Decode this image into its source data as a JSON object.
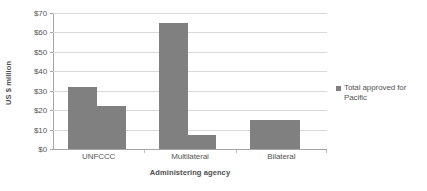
{
  "chart_data": {
    "type": "bar",
    "title": "",
    "categories": [
      "UNFCCC",
      "Multilateral",
      "Bilateral"
    ],
    "series": [
      {
        "name": "Total approved for Pacific",
        "color": "#808080",
        "bars": [
          {
            "category": "UNFCCC",
            "value": 32,
            "x_px": 68,
            "width_px": 29
          },
          {
            "category": "UNFCCC",
            "value": 22,
            "x_px": 97,
            "width_px": 29
          },
          {
            "category": "Multilateral",
            "value": 65,
            "x_px": 159,
            "width_px": 29
          },
          {
            "category": "Multilateral",
            "value": 7,
            "x_px": 188,
            "width_px": 28
          },
          {
            "category": "Bilateral",
            "value": 15,
            "x_px": 250,
            "width_px": 50
          }
        ]
      }
    ],
    "xlabel": "Administering agency",
    "ylabel": "US $ million",
    "ylim": [
      0,
      70
    ],
    "ytick_step": 10,
    "ytick_labels": [
      "$0",
      "$10",
      "$20",
      "$30",
      "$40",
      "$50",
      "$60",
      "$70"
    ],
    "ytick_values": [
      0,
      10,
      20,
      30,
      40,
      50,
      60,
      70
    ],
    "grid": true,
    "legend_position": "right",
    "legend_entries": [
      "Total approved for Pacific"
    ],
    "gridline_color": "#d9d9d9",
    "axis_color": "#a6a6a6",
    "bar_color": "#808080",
    "background": "#ffffff"
  },
  "legend": {
    "marker_icon": "legend-square-icon",
    "label": "Total approved for Pacific"
  },
  "axes": {
    "y_title": "US $ million",
    "x_title": "Administering agency"
  }
}
